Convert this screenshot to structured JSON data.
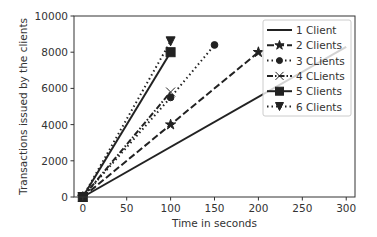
{
  "chart_data": {
    "type": "line",
    "title": "",
    "xlabel": "Time in seconds",
    "ylabel": "Transactions issued by the clients",
    "xlim": [
      -10,
      310
    ],
    "ylim": [
      0,
      10000
    ],
    "xticks": [
      0,
      50,
      100,
      150,
      200,
      250,
      300
    ],
    "yticks": [
      0,
      2000,
      4000,
      6000,
      8000,
      10000
    ],
    "grid": false,
    "legend_position": "upper right",
    "series": [
      {
        "name": "1 Client",
        "style": "solid",
        "marker": "none",
        "x": [
          0,
          300
        ],
        "y": [
          0,
          8300
        ]
      },
      {
        "name": "2 Clients",
        "style": "dashed",
        "marker": "star",
        "x": [
          0,
          100,
          200
        ],
        "y": [
          0,
          4000,
          8000
        ]
      },
      {
        "name": "3 CLients",
        "style": "dotted",
        "marker": "circle",
        "x": [
          0,
          100,
          150
        ],
        "y": [
          0,
          5500,
          8400
        ]
      },
      {
        "name": "4 CLients",
        "style": "dashdot",
        "marker": "x",
        "x": [
          0,
          100
        ],
        "y": [
          0,
          5800
        ]
      },
      {
        "name": "5 Clients",
        "style": "solid",
        "marker": "square",
        "x": [
          0,
          100
        ],
        "y": [
          0,
          8000
        ]
      },
      {
        "name": "6 Clients",
        "style": "dotted",
        "marker": "triangle-down",
        "x": [
          0,
          100
        ],
        "y": [
          0,
          8600
        ]
      }
    ]
  }
}
